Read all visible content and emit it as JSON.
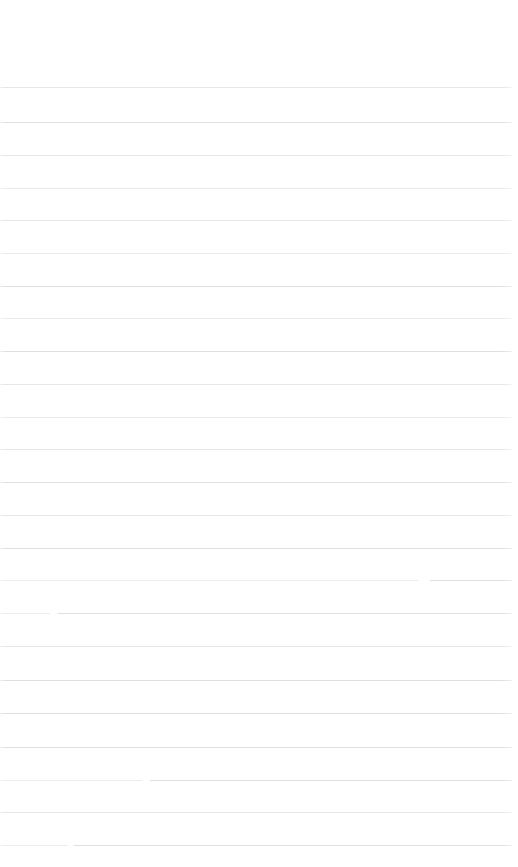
{
  "document": {
    "type": "ruled-paper",
    "title": "",
    "page_background": "#ffffff",
    "rule_color": "#e3e4e6",
    "width_px": 518,
    "height_px": 867,
    "top_margin_px": 87,
    "line_spacing_px": 32.9,
    "line_count": 24,
    "left_margin_px": 0,
    "right_inset_px": 6,
    "has_visible_text": false,
    "notes": "Blank ruled/lined page. No headings, body text, page numbers, annotations or marks are rendered in the pixels."
  },
  "lines": [
    {
      "index": 1,
      "y": 87,
      "tone": "tone-a",
      "text": ""
    },
    {
      "index": 2,
      "y": 122,
      "tone": "tone-b",
      "text": ""
    },
    {
      "index": 3,
      "y": 155,
      "tone": "tone-a",
      "text": ""
    },
    {
      "index": 4,
      "y": 188,
      "tone": "tone-c",
      "text": ""
    },
    {
      "index": 5,
      "y": 220,
      "tone": "tone-a",
      "text": ""
    },
    {
      "index": 6,
      "y": 253,
      "tone": "tone-c",
      "text": ""
    },
    {
      "index": 7,
      "y": 286,
      "tone": "tone-b",
      "text": ""
    },
    {
      "index": 8,
      "y": 318,
      "tone": "tone-c",
      "text": ""
    },
    {
      "index": 9,
      "y": 351,
      "tone": "tone-b",
      "text": ""
    },
    {
      "index": 10,
      "y": 384,
      "tone": "tone-a",
      "text": ""
    },
    {
      "index": 11,
      "y": 417,
      "tone": "tone-c",
      "text": ""
    },
    {
      "index": 12,
      "y": 449,
      "tone": "tone-a",
      "text": ""
    },
    {
      "index": 13,
      "y": 482,
      "tone": "tone-b",
      "text": ""
    },
    {
      "index": 14,
      "y": 515,
      "tone": "tone-a",
      "text": ""
    },
    {
      "index": 15,
      "y": 548,
      "tone": "tone-b",
      "text": ""
    },
    {
      "index": 16,
      "y": 580,
      "tone": "tone-b",
      "text": "",
      "break": {
        "gap_start": 418,
        "gap_end": 430
      }
    },
    {
      "index": 17,
      "y": 613,
      "tone": "tone-c",
      "text": "",
      "break": {
        "gap_start": 50,
        "gap_end": 58
      }
    },
    {
      "index": 18,
      "y": 646,
      "tone": "tone-a",
      "text": ""
    },
    {
      "index": 19,
      "y": 680,
      "tone": "tone-b",
      "text": ""
    },
    {
      "index": 20,
      "y": 713,
      "tone": "tone-b",
      "text": ""
    },
    {
      "index": 21,
      "y": 747,
      "tone": "tone-b",
      "text": ""
    },
    {
      "index": 22,
      "y": 780,
      "tone": "tone-b",
      "text": "",
      "break": {
        "gap_start": 142,
        "gap_end": 150
      }
    },
    {
      "index": 23,
      "y": 812,
      "tone": "tone-a",
      "text": ""
    },
    {
      "index": 24,
      "y": 845,
      "tone": "tone-b",
      "text": "",
      "break": {
        "gap_start": 68,
        "gap_end": 74
      }
    }
  ]
}
